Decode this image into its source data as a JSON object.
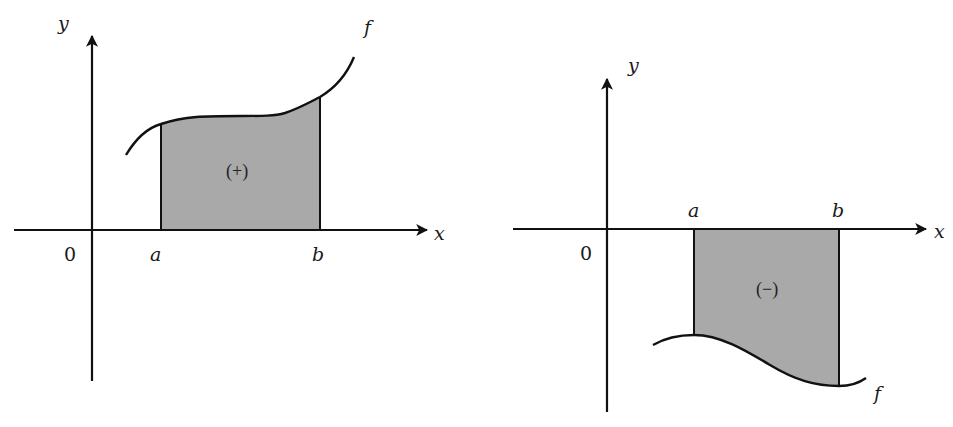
{
  "figure": {
    "left_panel": {
      "axes": {
        "x_label": "x",
        "y_label": "y",
        "origin_label": "0"
      },
      "bounds": {
        "a_label": "a",
        "b_label": "b"
      },
      "curve_label": "f",
      "region_label": "(+)",
      "region_sign": "positive",
      "description": "Area under f between a and b lies above the x-axis"
    },
    "right_panel": {
      "axes": {
        "x_label": "x",
        "y_label": "y",
        "origin_label": "0"
      },
      "bounds": {
        "a_label": "a",
        "b_label": "b"
      },
      "curve_label": "f",
      "region_label": "(−)",
      "region_sign": "negative",
      "description": "Area between f and x-axis from a to b lies below the x-axis"
    },
    "colors": {
      "shade": "#a9a9a9",
      "line": "#111111",
      "background": "#ffffff"
    }
  }
}
